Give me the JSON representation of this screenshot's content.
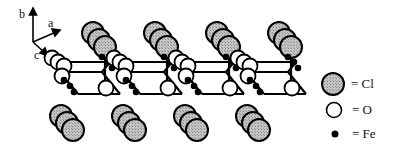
{
  "axes": {
    "labels": {
      "a": "a",
      "b": "b",
      "c": "c"
    }
  },
  "legend": {
    "items": [
      {
        "symbol": "large-hatched-gray-sphere",
        "label": "= Cl"
      },
      {
        "symbol": "white-sphere",
        "label": "= O"
      },
      {
        "symbol": "small-black-sphere",
        "label": "= Fe"
      }
    ]
  },
  "colors": {
    "cl_fill": "#b4b4b4",
    "o_fill": "#ffffff",
    "fe_fill": "#000000",
    "stroke": "#000000"
  },
  "structure": {
    "description": "FeOCl layered crystal structure",
    "top_cl_columns": 4,
    "bottom_cl_columns": 4
  }
}
